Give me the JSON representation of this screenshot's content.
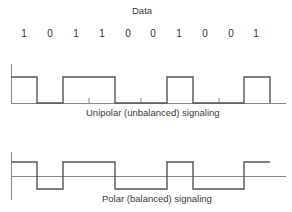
{
  "title": "Data",
  "bits": [
    "1",
    "0",
    "1",
    "1",
    "0",
    "0",
    "1",
    "0",
    "0",
    "1"
  ],
  "captions": {
    "unipolar": "Unipolar (unbalanced) signaling",
    "polar": "Polar (balanced) signaling"
  },
  "colors": {
    "line": "#555555",
    "axis": "#888888",
    "text": "#333333"
  }
}
